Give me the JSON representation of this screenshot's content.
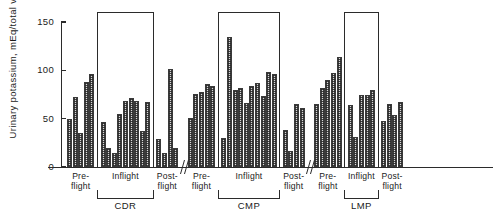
{
  "chart_data": {
    "type": "bar",
    "title": "",
    "subtitle": "",
    "xlabel": "",
    "ylabel": "Urinary potassium, mEq/total volume",
    "ylim": [
      0,
      150
    ],
    "ytick_labels": [
      "0",
      "50",
      "100",
      "150"
    ],
    "ytick_values": [
      0,
      50,
      100,
      150
    ],
    "grid": false,
    "legend": "none",
    "axis_break_marker": "//",
    "groups": [
      {
        "name": "CDR",
        "phases": [
          {
            "label_line1": "Pre-",
            "label_line2": "flight",
            "name": "Pre-flight",
            "values": [
              50,
              72,
              35,
              88,
              96
            ]
          },
          {
            "label_line1": "Inflight",
            "label_line2": "",
            "name": "Inflight",
            "values": [
              47,
              20,
              15,
              55,
              68,
              71,
              68,
              37,
              67
            ]
          },
          {
            "label_line1": "Post-",
            "label_line2": "flight",
            "name": "Post-flight",
            "values": [
              29,
              14,
              101,
              20
            ]
          }
        ]
      },
      {
        "name": "CMP",
        "phases": [
          {
            "label_line1": "Pre-",
            "label_line2": "flight",
            "name": "Pre-flight",
            "values": [
              51,
              76,
              78,
              86,
              84
            ]
          },
          {
            "label_line1": "Inflight",
            "label_line2": "",
            "name": "Inflight",
            "values": [
              30,
              135,
              80,
              82,
              66,
              84,
              87,
              73,
              98,
              96
            ]
          },
          {
            "label_line1": "Post-",
            "label_line2": "flight",
            "name": "Post-flight",
            "values": [
              38,
              17,
              65,
              61
            ]
          }
        ]
      },
      {
        "name": "LMP",
        "phases": [
          {
            "label_line1": "Pre-",
            "label_line2": "flight",
            "name": "Pre-flight",
            "values": [
              65,
              82,
              90,
              97,
              114
            ]
          },
          {
            "label_line1": "Inflight",
            "label_line2": "",
            "name": "Inflight",
            "values": [
              64,
              31,
              75,
              75,
              80
            ]
          },
          {
            "label_line1": "Post-",
            "label_line2": "flight",
            "name": "Post-flight",
            "values": [
              48,
              65,
              54,
              67
            ]
          }
        ]
      }
    ]
  }
}
